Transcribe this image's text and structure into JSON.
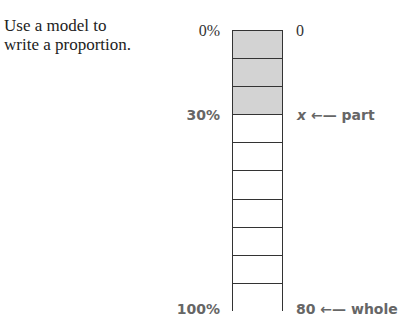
{
  "caption": [
    "Use a model to",
    "write a proportion."
  ],
  "left_labels": {
    "top": "0%",
    "mid": "30%",
    "bottom": "100%"
  },
  "right_labels": {
    "top": "0",
    "mid_value": "x",
    "mid_arrow": "←—",
    "mid_text": "part",
    "bottom_value": "80",
    "bottom_arrow": "←—",
    "bottom_text": "whole"
  },
  "model": {
    "total_cells": 10,
    "shaded_cells": 3,
    "shade_color": "#d3d3d3"
  }
}
